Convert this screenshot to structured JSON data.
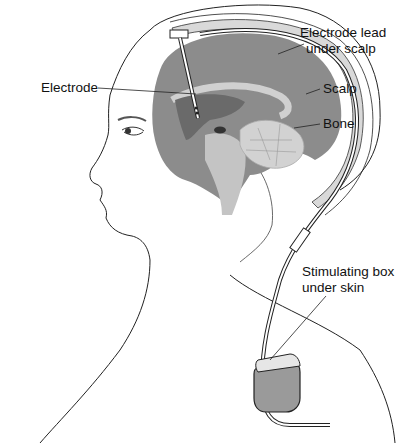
{
  "diagram": {
    "type": "anatomical illustration",
    "labels": {
      "electrode": "Electrode",
      "electrode_lead_line1": "Electrode lead",
      "electrode_lead_line2": "under scalp",
      "scalp": "Scalp",
      "bone": "Bone",
      "stim_box_line1": "Stimulating box",
      "stim_box_line2": "under skin"
    },
    "colors": {
      "brain": "#8c8c8c",
      "brain_light": "#c8c8c8",
      "deep_structure": "#6f6f6f",
      "outline": "#222222",
      "bone": "#d4d4d4",
      "device": "#9a9a9a"
    }
  }
}
